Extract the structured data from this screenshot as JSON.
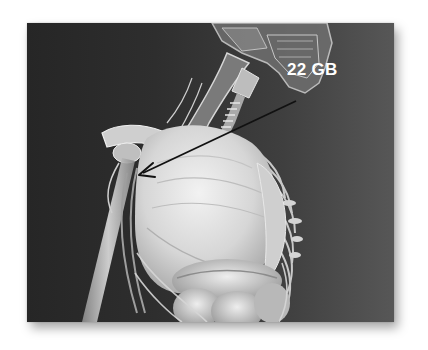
{
  "figure": {
    "callout": {
      "label": "22 GB",
      "label_color": "#ffffff",
      "arrow_color": "#111111",
      "arrow_from": [
        296,
        101
      ],
      "arrow_to": [
        139,
        174
      ]
    },
    "colors": {
      "background_dark": "#262626",
      "background_light": "#575757",
      "bone": "#d9d9d9",
      "organ": "#e6e6e6",
      "page": "#ffffff"
    }
  }
}
